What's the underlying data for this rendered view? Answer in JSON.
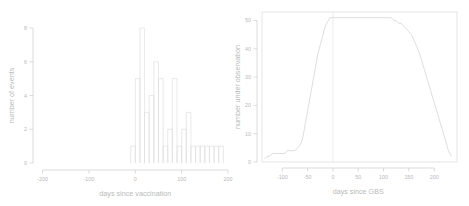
{
  "figure": {
    "title": "",
    "panel_count": 2
  },
  "chart_data": [
    {
      "type": "bar",
      "id": "histogram-days-since-vaccination",
      "title": "",
      "xlabel": "days since vaccination",
      "ylabel": "number of events",
      "xlim": [
        -210,
        200
      ],
      "ylim": [
        0,
        8
      ],
      "xticks": [
        -200,
        -100,
        0,
        100,
        200
      ],
      "xticklabels": [
        "-200",
        "-100",
        "0",
        "100",
        "200"
      ],
      "yticks": [
        0,
        2,
        4,
        6,
        8
      ],
      "yticklabels": [
        "0",
        "2",
        "4",
        "6",
        "8"
      ],
      "grid": false,
      "legend": "none",
      "bin_width": 10,
      "bin_starts": [
        -10,
        0,
        10,
        20,
        30,
        40,
        50,
        60,
        70,
        80,
        90,
        100,
        110,
        120,
        130,
        140,
        150,
        160,
        170,
        180
      ],
      "categories": [
        "-10",
        "0",
        "10",
        "20",
        "30",
        "40",
        "50",
        "60",
        "70",
        "80",
        "90",
        "100",
        "110",
        "120",
        "130",
        "140",
        "150",
        "160",
        "170",
        "180"
      ],
      "values": [
        1,
        5,
        8,
        3,
        4,
        6,
        5,
        1,
        2,
        5,
        1,
        2,
        3,
        1,
        1,
        1,
        1,
        1,
        1,
        1
      ]
    },
    {
      "type": "line",
      "id": "number-under-observation-days-since-gbs",
      "title": "",
      "xlabel": "days since GBS",
      "ylabel": "number under observation",
      "xlim": [
        -140,
        245
      ],
      "ylim": [
        0,
        53
      ],
      "xticks": [
        -100,
        -50,
        0,
        50,
        100,
        150,
        200
      ],
      "xticklabels": [
        "-100",
        "-50",
        "0",
        "50",
        "100",
        "150",
        "200"
      ],
      "yticks": [
        0,
        10,
        20,
        30,
        40,
        50
      ],
      "yticklabels": [
        "0",
        "10",
        "20",
        "30",
        "40",
        "50"
      ],
      "grid": false,
      "legend": "none",
      "annotations": [
        {
          "name": "reference-line-zero",
          "x": 0
        }
      ],
      "x": [
        -135,
        -130,
        -125,
        -120,
        -115,
        -110,
        -105,
        -100,
        -95,
        -90,
        -85,
        -80,
        -75,
        -70,
        -65,
        -60,
        -57,
        -54,
        -51,
        -48,
        -45,
        -42,
        -39,
        -36,
        -33,
        -30,
        -27,
        -24,
        -21,
        -18,
        -15,
        -12,
        -9,
        -6,
        -3,
        0,
        10,
        20,
        30,
        40,
        50,
        60,
        70,
        80,
        90,
        100,
        110,
        115,
        120,
        125,
        130,
        135,
        140,
        145,
        150,
        155,
        160,
        165,
        170,
        175,
        180,
        185,
        190,
        195,
        200,
        205,
        210,
        215,
        220,
        225,
        228,
        231,
        234
      ],
      "y": [
        1,
        2,
        2,
        3,
        3,
        3,
        3,
        3,
        3,
        4,
        4,
        4,
        4,
        5,
        6,
        8,
        11,
        14,
        17,
        20,
        23,
        26,
        29,
        32,
        35,
        38,
        40,
        42,
        44,
        46,
        48,
        49,
        50,
        51,
        51,
        51,
        51,
        51,
        51,
        51,
        51,
        51,
        51,
        51,
        51,
        51,
        51,
        51,
        50,
        50,
        49,
        49,
        48,
        47,
        46,
        45,
        43,
        41,
        39,
        36,
        33,
        30,
        27,
        24,
        21,
        18,
        15,
        12,
        9,
        6,
        4,
        3,
        2
      ]
    }
  ]
}
